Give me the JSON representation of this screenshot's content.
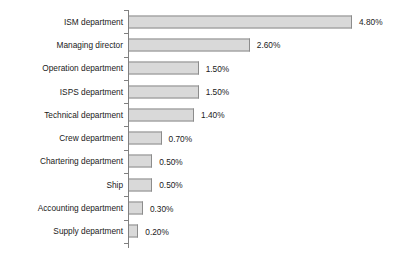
{
  "chart_data": {
    "type": "bar",
    "orientation": "horizontal",
    "title": "",
    "subtitle": "",
    "xlabel": "",
    "ylabel": "",
    "grid": false,
    "legend": null,
    "value_suffix": "%",
    "xlim": [
      0,
      4.8
    ],
    "categories": [
      "ISM department",
      "Managing director",
      "Operation department",
      "ISPS department",
      "Technical department",
      "Crew department",
      "Chartering department",
      "Ship",
      "Accounting department",
      "Supply department"
    ],
    "values": [
      4.8,
      2.6,
      1.5,
      1.5,
      1.4,
      0.7,
      0.5,
      0.5,
      0.3,
      0.2
    ],
    "labels": [
      "4.80%",
      "2.60%",
      "1.50%",
      "1.50%",
      "1.40%",
      "0.70%",
      "0.50%",
      "0.50%",
      "0.30%",
      "0.20%"
    ],
    "colors": {
      "bar_fill": "#d9d9d9",
      "bar_border": "#8c8c8c",
      "axis": "#808080",
      "text": "#1a1a1a",
      "background": "#ffffff"
    }
  }
}
